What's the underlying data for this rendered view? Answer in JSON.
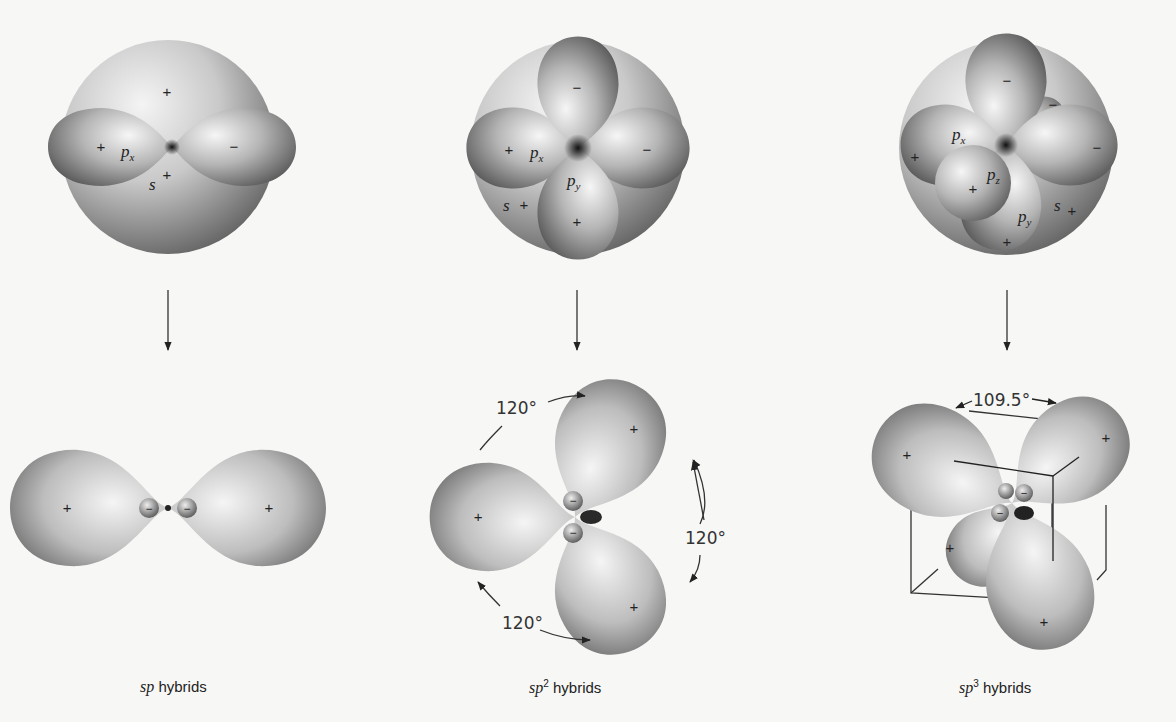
{
  "figure": {
    "panels": [
      {
        "id": "sp",
        "top": {
          "orbitals": [
            "s",
            "p_x"
          ],
          "labels": {
            "s": "s",
            "px": "p",
            "px_sub": "x"
          },
          "signs": {
            "s_top": "+",
            "s_bottom": "+",
            "px_left": "+",
            "px_right": "−"
          }
        },
        "bottom": {
          "hybrid_lobes": 2,
          "lobe_signs": [
            "+",
            "+"
          ],
          "small_lobe_signs": [
            "−",
            "−"
          ]
        },
        "caption": {
          "italic": "sp",
          "superscript": "",
          "text": " hybrids"
        }
      },
      {
        "id": "sp2",
        "top": {
          "orbitals": [
            "s",
            "p_x",
            "p_y"
          ],
          "labels": {
            "s": "s",
            "px": "p",
            "px_sub": "x",
            "py": "p",
            "py_sub": "y"
          },
          "signs": {
            "s": "+",
            "px_left": "+",
            "px_right": "−",
            "py_top": "−",
            "py_bottom": "+"
          }
        },
        "bottom": {
          "hybrid_lobes": 3,
          "lobe_signs": [
            "+",
            "+",
            "+"
          ],
          "small_lobe_signs": [
            "−",
            "−",
            "−"
          ],
          "angles": [
            "120°",
            "120°",
            "120°"
          ]
        },
        "caption": {
          "italic": "sp",
          "superscript": "2",
          "text": " hybrids"
        }
      },
      {
        "id": "sp3",
        "top": {
          "orbitals": [
            "s",
            "p_x",
            "p_y",
            "p_z"
          ],
          "labels": {
            "s": "s",
            "px": "p",
            "px_sub": "x",
            "py": "p",
            "py_sub": "y",
            "pz": "p",
            "pz_sub": "z"
          },
          "signs": {
            "s": "+",
            "px_left": "+",
            "px_right": "−",
            "py_top": "−",
            "py_bottom": "+",
            "pz_front": "+",
            "pz_back": "−"
          }
        },
        "bottom": {
          "hybrid_lobes": 4,
          "lobe_signs": [
            "+",
            "+",
            "+",
            "+"
          ],
          "small_lobe_signs": [
            "−",
            "−",
            "−",
            "−"
          ],
          "angles": [
            "109.5°"
          ]
        },
        "caption": {
          "italic": "sp",
          "superscript": "3",
          "text": " hybrids"
        }
      }
    ]
  }
}
